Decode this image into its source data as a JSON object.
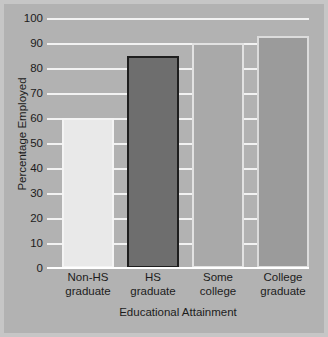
{
  "chart_data": {
    "type": "bar",
    "title": "",
    "xlabel": "Educational Attainment",
    "ylabel": "Percentage Employed",
    "categories": [
      "Non-HS graduate",
      "HS graduate",
      "Some college",
      "College graduate"
    ],
    "category_lines": [
      [
        "Non-HS",
        "graduate"
      ],
      [
        "HS",
        "graduate"
      ],
      [
        "Some",
        "college"
      ],
      [
        "College",
        "graduate"
      ]
    ],
    "values": [
      60,
      85,
      90,
      93
    ],
    "ylim": [
      0,
      100
    ],
    "yticks": [
      0,
      10,
      20,
      30,
      40,
      50,
      60,
      70,
      80,
      90,
      100
    ],
    "ytick_labels": [
      "0",
      "10",
      "20",
      "30",
      "40",
      "50",
      "60",
      "70",
      "80",
      "90",
      "100"
    ],
    "grid": true,
    "legend": "none",
    "bar_colors": [
      "#e9e9e9",
      "#6e6e6e",
      "#a9a9a9",
      "#9b9b9b"
    ],
    "bar_edge_colors": [
      "#f4f4f4",
      "#1e1e1e",
      "#e2e2e2",
      "#dcdcdc"
    ],
    "plot_background": "#b2b2b2",
    "gridline_color": "#f2f2f2",
    "figure_background": "#b4b4b4",
    "frame_color": "#c6c6c6",
    "text_color": "#1c1c1c"
  }
}
